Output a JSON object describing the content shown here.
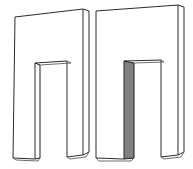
{
  "figure": {
    "background_color": "#ffffff",
    "line_color": "#2b2b2b",
    "shade_color": "#808080",
    "canvas": {
      "width": 193,
      "height": 169
    },
    "objects": [
      {
        "id": "left-arch",
        "name": "Left arch solid",
        "shaded": false,
        "front_face_color": "#ffffff",
        "side_face_color": "#ffffff",
        "outer_front": [
          [
            15,
            17
          ],
          [
            83,
            9
          ],
          [
            83,
            155
          ],
          [
            67,
            157
          ],
          [
            67,
            61
          ],
          [
            35,
            63
          ],
          [
            35,
            159
          ],
          [
            13,
            158
          ]
        ],
        "side_strip": [
          [
            83,
            9
          ],
          [
            89,
            11
          ],
          [
            89,
            152
          ],
          [
            83,
            155
          ]
        ],
        "notch_inner_side": [
          [
            35,
            63
          ],
          [
            40,
            65
          ],
          [
            40,
            158
          ],
          [
            35,
            159
          ]
        ],
        "notch_inner_top": [
          [
            35,
            63
          ],
          [
            40,
            65
          ],
          [
            71,
            63
          ],
          [
            67,
            61
          ]
        ]
      },
      {
        "id": "right-arch",
        "name": "Right arch solid with shaded inner face",
        "shaded": true,
        "front_face_color": "#ffffff",
        "shaded_face_color": "#808080",
        "outer_front": [
          [
            96,
            11
          ],
          [
            178,
            5
          ],
          [
            178,
            155
          ],
          [
            161,
            157
          ],
          [
            161,
            60
          ],
          [
            124,
            61
          ],
          [
            124,
            159
          ],
          [
            96,
            158
          ]
        ],
        "side_strip": [
          [
            178,
            5
          ],
          [
            184,
            7
          ],
          [
            184,
            152
          ],
          [
            178,
            155
          ]
        ],
        "notch_inner_side_shaded": [
          [
            124,
            61
          ],
          [
            134,
            63
          ],
          [
            134,
            158
          ],
          [
            124,
            159
          ]
        ],
        "notch_inner_top": [
          [
            124,
            61
          ],
          [
            134,
            63
          ],
          [
            164,
            62
          ],
          [
            161,
            60
          ]
        ]
      }
    ]
  },
  "labels": {
    "left_shape_name": "",
    "right_shape_name": "",
    "caption": ""
  }
}
